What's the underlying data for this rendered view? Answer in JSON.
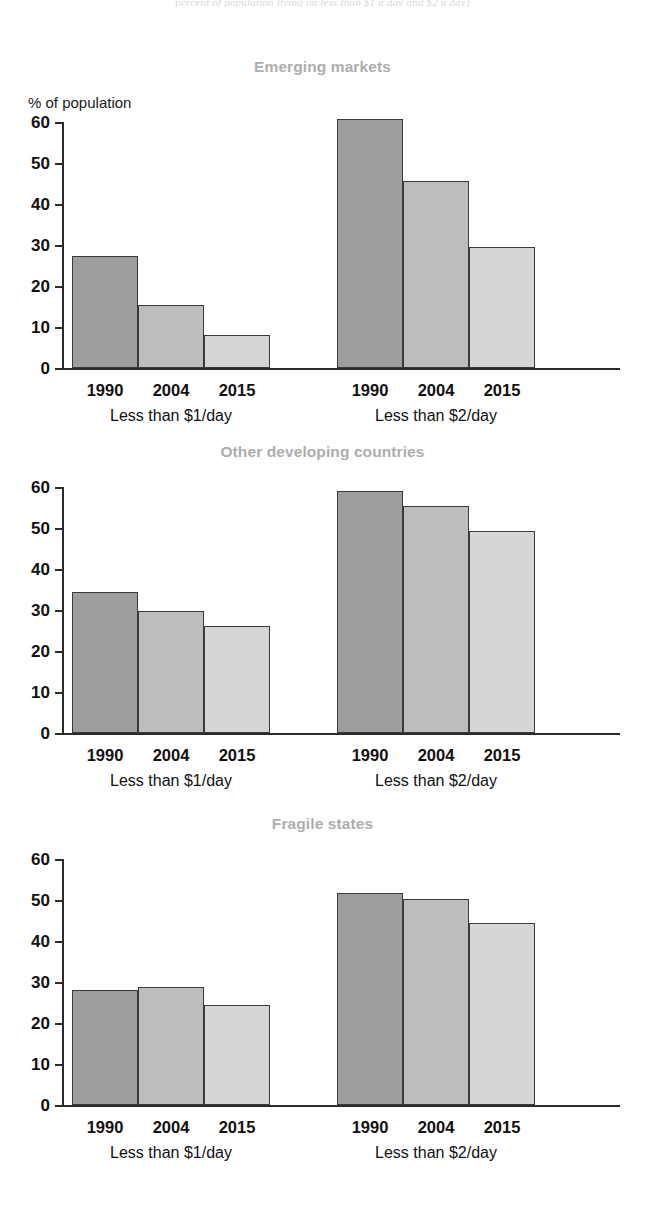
{
  "top_caption": "percent of population living on less than $1 a day and $2 a day)",
  "y_axis_label": "% of population",
  "axis": {
    "ticks": [
      "60",
      "50",
      "40",
      "30",
      "20",
      "10",
      "0"
    ],
    "min": 0,
    "max": 60
  },
  "group_labels": {
    "dollar1": "Less than $1/day",
    "dollar2": "Less than $2/day"
  },
  "years": [
    "1990",
    "2004",
    "2015"
  ],
  "colors": {
    "series_1990": "#9d9d9d",
    "series_2004": "#bdbdbd",
    "series_2015": "#d6d6d6",
    "title": "#adadad",
    "axis": "#2b2b2b"
  },
  "panels": [
    {
      "title": "Emerging markets",
      "groups": [
        {
          "label": "Less than $1/day",
          "values": [
            27.4,
            15.3,
            8.0
          ]
        },
        {
          "label": "Less than $2/day",
          "values": [
            60.8,
            45.5,
            29.5
          ]
        }
      ]
    },
    {
      "title": "Other developing countries",
      "groups": [
        {
          "label": "Less than $1/day",
          "values": [
            34.5,
            29.7,
            26.1
          ]
        },
        {
          "label": "Less than $2/day",
          "values": [
            59.1,
            55.4,
            49.2
          ]
        }
      ]
    },
    {
      "title": "Fragile states",
      "groups": [
        {
          "label": "Less than $1/day",
          "values": [
            28.1,
            28.9,
            24.4
          ]
        },
        {
          "label": "Less than $2/day",
          "values": [
            51.7,
            50.2,
            44.5
          ]
        }
      ]
    }
  ],
  "chart_data": {
    "type": "bar",
    "subtitle": "percent of population living on less than $1 a day and $2 a day)",
    "xlabel": "",
    "ylabel": "% of population",
    "ylim": [
      0,
      60
    ],
    "yticks": [
      0,
      10,
      20,
      30,
      40,
      50,
      60
    ],
    "grid": false,
    "legend": "none",
    "categories": [
      "1990",
      "2004",
      "2015"
    ],
    "panels": [
      {
        "name": "Emerging markets",
        "series": [
          {
            "name": "Less than $1/day",
            "values": [
              27.4,
              15.3,
              8.0
            ]
          },
          {
            "name": "Less than $2/day",
            "values": [
              60.8,
              45.5,
              29.5
            ]
          }
        ]
      },
      {
        "name": "Other developing countries",
        "series": [
          {
            "name": "Less than $1/day",
            "values": [
              34.5,
              29.7,
              26.1
            ]
          },
          {
            "name": "Less than $2/day",
            "values": [
              59.1,
              55.4,
              49.2
            ]
          }
        ]
      },
      {
        "name": "Fragile states",
        "series": [
          {
            "name": "Less than $1/day",
            "values": [
              28.1,
              28.9,
              24.4
            ]
          },
          {
            "name": "Less than $2/day",
            "values": [
              51.7,
              50.2,
              44.5
            ]
          }
        ]
      }
    ]
  }
}
